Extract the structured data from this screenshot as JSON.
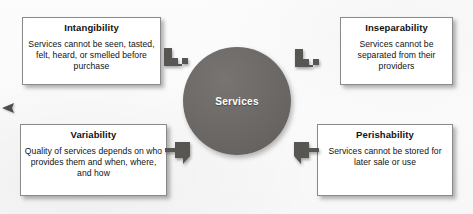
{
  "figure": {
    "center": {
      "label": "Services",
      "shape": "circle",
      "fill_color": "#6b6866",
      "text_color": "#ffffff"
    },
    "boxes": [
      {
        "id": "intangibility",
        "title": "Intangibility",
        "body": "Services cannot be seen, tasted, felt, heard, or smelled before purchase",
        "position": "top-left"
      },
      {
        "id": "inseparability",
        "title": "Inseparability",
        "body": "Services cannot be separated from their providers",
        "position": "top-right"
      },
      {
        "id": "variability",
        "title": "Variability",
        "body": "Quality of services depends on who provides them and when, where, and how",
        "position": "bottom-left"
      },
      {
        "id": "perishability",
        "title": "Perishability",
        "body": "Services cannot be stored for later sale or use",
        "position": "bottom-right"
      }
    ],
    "arrows": [
      {
        "id": "arrow-top-left",
        "direction": "down-right",
        "from": "intangibility",
        "to": "services"
      },
      {
        "id": "arrow-top-right",
        "direction": "down-left",
        "from": "inseparability",
        "to": "services"
      },
      {
        "id": "arrow-bottom-left",
        "direction": "up-right",
        "from": "variability",
        "to": "services"
      },
      {
        "id": "arrow-bottom-right",
        "direction": "up-left",
        "from": "perishability",
        "to": "services"
      }
    ],
    "colors": {
      "box_border": "#8a8a8a",
      "box_fill": "#ffffff",
      "arrow_fill": "#585653",
      "page_background": "#fcfcfc"
    }
  }
}
